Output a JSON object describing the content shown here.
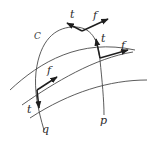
{
  "figure": {
    "labels": {
      "curve": "C",
      "start_point": "q",
      "end_point": "p",
      "tangent": "t",
      "field": "f"
    },
    "colors": {
      "background": "#ffffff",
      "lines": "#4a4a4a",
      "vectors": "#1e1e1e",
      "text": "#2a2a2a"
    },
    "intersections": [
      {
        "name": "top",
        "tangent_label": "t",
        "field_label": "f"
      },
      {
        "name": "right",
        "tangent_label": "t",
        "field_label": "f"
      },
      {
        "name": "lower-left",
        "tangent_label": "t",
        "field_label": "f"
      }
    ]
  }
}
